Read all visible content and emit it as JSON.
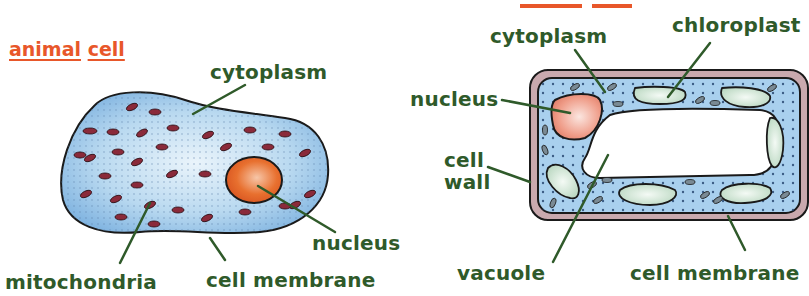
{
  "colors": {
    "label_green": "#2f5a2a",
    "title_orange": "#e8572a",
    "cytoplasm_blue": "#a9d0ee",
    "nucleus_orange": "#e2672c",
    "plant_nucleus": "#ee9a86",
    "mitochondria": "#8a2a3a",
    "chloroplast": "#cfe4d4",
    "cell_wall": "#c9a9ae"
  },
  "animal_cell": {
    "title_word1": "animal",
    "title_word2": "cell",
    "labels": {
      "cytoplasm": "cytoplasm",
      "nucleus": "nucleus",
      "mitochondria": "mitochondria",
      "cell_membrane": "cell membrane"
    }
  },
  "plant_cell": {
    "labels": {
      "cytoplasm": "cytoplasm",
      "chloroplast": "chloroplast",
      "nucleus": "nucleus",
      "cell_wall_line1": "cell",
      "cell_wall_line2": "wall",
      "vacuole": "vacuole",
      "cell_membrane": "cell membrane"
    }
  }
}
